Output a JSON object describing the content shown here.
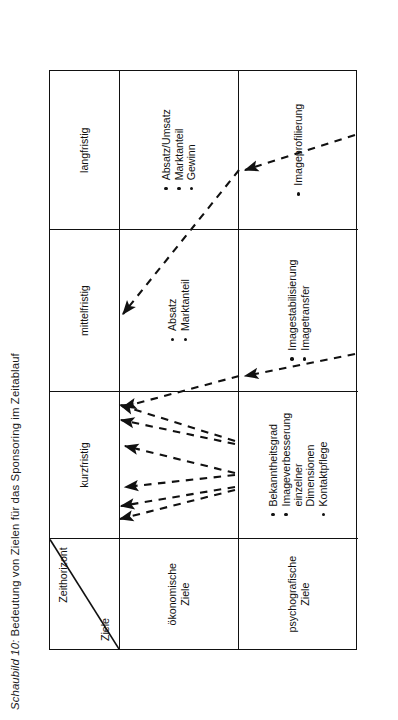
{
  "caption": {
    "number": "Schaubild 10:",
    "text": " Bedeutung von Zielen für das Sponsoring im Zeitablauf",
    "full": "Schaubild 10: Bedeutung von Zielen für das Sponsoring im Zeitablauf"
  },
  "table": {
    "corner": {
      "time_label": "Zeithorizont",
      "goal_label": "Ziele"
    },
    "column_headers": [
      "kurzfristig",
      "mittelfristig",
      "langfristig"
    ],
    "rows": [
      {
        "label": "ökonomische\nZiele",
        "cells": [
          {
            "items": []
          },
          {
            "items": [
              "Absatz",
              "Marktanteil"
            ]
          },
          {
            "items": [
              "Absatz/Umsatz",
              "Marktanteil",
              "Gewinn"
            ]
          }
        ]
      },
      {
        "label": "psychografische\nZiele",
        "cells": [
          {
            "items": [
              "Bekanntheitsgrad",
              "Imageverbesserung\neinzelner\nDimensionen",
              "Kontaktpflege"
            ]
          },
          {
            "items": [
              "Imagestabilisierung",
              "Imagetransfer"
            ]
          },
          {
            "items": [
              "Imageprofilierung"
            ]
          }
        ]
      }
    ]
  },
  "style": {
    "line_color": "#111111",
    "background": "#ffffff",
    "arrow_style": "dashed"
  }
}
